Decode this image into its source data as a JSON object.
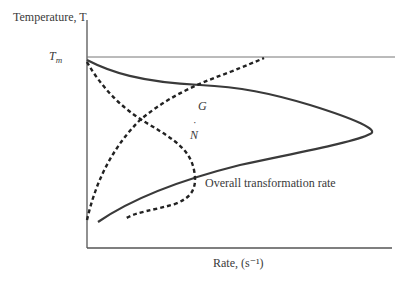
{
  "diagram": {
    "y_axis_label": "Temperature, T",
    "x_axis_label": "Rate, (s⁻¹)",
    "tm_label": "T",
    "tm_sub": "m",
    "curves": [
      {
        "name": "overall-transformation-rate",
        "label": "Overall transformation rate",
        "style": "solid"
      },
      {
        "name": "growth-rate",
        "label": "G",
        "style": "dashed"
      },
      {
        "name": "nucleation-rate",
        "label": "N",
        "label_accent": "˙",
        "style": "dashed"
      }
    ],
    "colors": {
      "line": "#3a3a3a",
      "axis": "#555555"
    }
  }
}
